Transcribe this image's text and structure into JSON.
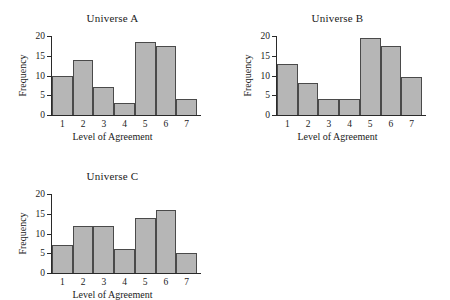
{
  "figure": {
    "background": "#ffffff",
    "bar_fill": "#b6b6b6",
    "bar_edge": "#4a4a4a",
    "axis_color": "#2a2a2a"
  },
  "chart_data": [
    {
      "type": "bar",
      "title": "Universe A",
      "xlabel": "Level of Agreement",
      "ylabel": "Frequency",
      "categories": [
        "1",
        "2",
        "3",
        "4",
        "5",
        "6",
        "7"
      ],
      "values": [
        10,
        14,
        7,
        3,
        18.5,
        17.5,
        4
      ],
      "ylim": [
        0,
        20
      ],
      "yticks": [
        0,
        5,
        10,
        15,
        20
      ],
      "ytick_labels": [
        "0",
        "5",
        "10",
        "15",
        "20"
      ],
      "grid": false,
      "legend": null
    },
    {
      "type": "bar",
      "title": "Universe B",
      "xlabel": "Level of Agreement",
      "ylabel": "Frequency",
      "categories": [
        "1",
        "2",
        "3",
        "4",
        "5",
        "6",
        "7"
      ],
      "values": [
        13,
        8,
        4,
        4,
        19.5,
        17.5,
        9.5
      ],
      "ylim": [
        0,
        20
      ],
      "yticks": [
        0,
        5,
        10,
        15,
        20
      ],
      "ytick_labels": [
        "0",
        "5",
        "10",
        "15",
        "20"
      ],
      "grid": false,
      "legend": null
    },
    {
      "type": "bar",
      "title": "Universe C",
      "xlabel": "Level of Agreement",
      "ylabel": "Frequency",
      "categories": [
        "1",
        "2",
        "3",
        "4",
        "5",
        "6",
        "7"
      ],
      "values": [
        7,
        12,
        12,
        6,
        14,
        16,
        5
      ],
      "ylim": [
        0,
        20
      ],
      "yticks": [
        0,
        5,
        10,
        15,
        20
      ],
      "ytick_labels": [
        "0",
        "5",
        "10",
        "15",
        "20"
      ],
      "grid": false,
      "legend": null
    }
  ]
}
